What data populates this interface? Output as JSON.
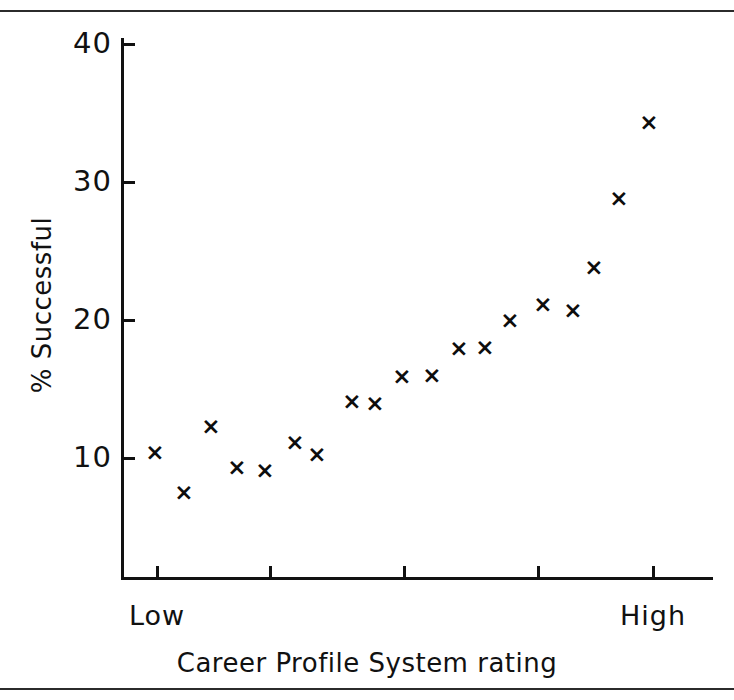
{
  "figure": {
    "background_color": "#ffffff",
    "ink_color": "#111111",
    "rules": [
      {
        "name": "top-rule",
        "y": 10
      },
      {
        "name": "bottom-rule",
        "y": 688
      }
    ]
  },
  "chart_data": {
    "type": "scatter",
    "title": "",
    "xlabel": "Career Profile System rating",
    "ylabel": "% Successful",
    "x_tick_labels": [
      "Low",
      "",
      "",
      "",
      "High"
    ],
    "x_tick_positions": [
      157,
      270,
      404,
      538,
      653
    ],
    "y_ticks": [
      10,
      20,
      30,
      40
    ],
    "ylim": [
      0,
      42
    ],
    "xlim": [
      0,
      20
    ],
    "grid": false,
    "legend": false,
    "marker": "x",
    "marker_color": "#0d0d0d",
    "x": [
      1,
      2,
      3,
      4,
      5,
      6,
      7,
      8,
      9,
      10,
      11,
      12,
      13,
      14,
      15,
      16,
      17,
      18,
      19
    ],
    "values": [
      10.4,
      7.1,
      12.3,
      9.4,
      9.2,
      11.2,
      10.3,
      14.1,
      14.0,
      15.9,
      16.0,
      18.0,
      18.0,
      20.0,
      21.2,
      20.7,
      23.8,
      28.8,
      34.3
    ],
    "points": [
      {
        "px": 155,
        "py": 452,
        "y": 10.4
      },
      {
        "px": 184,
        "py": 492,
        "y": 7.1
      },
      {
        "px": 211,
        "py": 426,
        "y": 12.3
      },
      {
        "px": 237,
        "py": 467,
        "y": 9.4
      },
      {
        "px": 265,
        "py": 470,
        "y": 9.2
      },
      {
        "px": 295,
        "py": 442,
        "y": 11.2
      },
      {
        "px": 317,
        "py": 454,
        "y": 10.3
      },
      {
        "px": 352,
        "py": 401,
        "y": 14.1
      },
      {
        "px": 375,
        "py": 403,
        "y": 14.0
      },
      {
        "px": 402,
        "py": 376,
        "y": 15.9
      },
      {
        "px": 432,
        "py": 375,
        "y": 16.0
      },
      {
        "px": 459,
        "py": 348,
        "y": 18.0
      },
      {
        "px": 485,
        "py": 347,
        "y": 18.0
      },
      {
        "px": 510,
        "py": 320,
        "y": 20.0
      },
      {
        "px": 543,
        "py": 304,
        "y": 21.2
      },
      {
        "px": 573,
        "py": 310,
        "y": 20.7
      },
      {
        "px": 594,
        "py": 267,
        "y": 23.8
      },
      {
        "px": 619,
        "py": 198,
        "y": 28.8
      },
      {
        "px": 649,
        "py": 122,
        "y": 34.3
      }
    ],
    "marker_glyph": "×"
  },
  "axes": {
    "y_tick_entries": [
      {
        "label": "40",
        "py": 44
      },
      {
        "label": "30",
        "py": 182
      },
      {
        "label": "20",
        "py": 320
      },
      {
        "label": "10",
        "py": 458
      }
    ],
    "x_tick_entries": [
      {
        "label": "Low",
        "px": 157
      },
      {
        "label": "",
        "px": 270
      },
      {
        "label": "",
        "px": 404
      },
      {
        "label": "",
        "px": 538
      },
      {
        "label": "High",
        "px": 653
      }
    ]
  }
}
